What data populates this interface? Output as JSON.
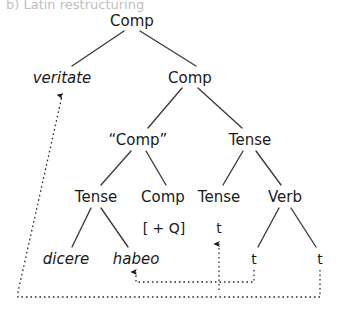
{
  "figure": {
    "caption": "b)  Latin restructuring",
    "background_color": "#ffffff",
    "line_color": "#3a3a3a",
    "text_color": "#1a1a1a",
    "width": 340,
    "height": 317
  },
  "tree": {
    "nodes": [
      {
        "id": "comp-root",
        "label": "Comp",
        "x": 132,
        "y": 21,
        "style": "plain"
      },
      {
        "id": "veritate",
        "label": "veritate",
        "x": 62,
        "y": 78,
        "style": "italic"
      },
      {
        "id": "comp-2",
        "label": "Comp",
        "x": 190,
        "y": 78,
        "style": "plain"
      },
      {
        "id": "comp-quoted",
        "label": "“Comp”",
        "x": 138,
        "y": 140,
        "style": "plain"
      },
      {
        "id": "tense-right",
        "label": "Tense",
        "x": 250,
        "y": 140,
        "style": "plain"
      },
      {
        "id": "tense-l1",
        "label": "Tense",
        "x": 96,
        "y": 197,
        "style": "plain"
      },
      {
        "id": "comp-l1",
        "label": "Comp",
        "x": 163,
        "y": 197,
        "style": "plain"
      },
      {
        "id": "tense-l2",
        "label": "Tense",
        "x": 219,
        "y": 197,
        "style": "plain"
      },
      {
        "id": "verb",
        "label": "Verb",
        "x": 285,
        "y": 197,
        "style": "plain"
      },
      {
        "id": "feature-q",
        "label": "[ + Q]",
        "x": 164,
        "y": 228,
        "style": "feature"
      },
      {
        "id": "trace-tense",
        "label": "t",
        "x": 219,
        "y": 228,
        "style": "trace"
      },
      {
        "id": "dicere",
        "label": "dicere",
        "x": 66,
        "y": 259,
        "style": "italic"
      },
      {
        "id": "habeo",
        "label": "habeo",
        "x": 136,
        "y": 259,
        "style": "italic"
      },
      {
        "id": "trace-verb-1",
        "label": "t",
        "x": 254,
        "y": 259,
        "style": "trace"
      },
      {
        "id": "trace-verb-2",
        "label": "t",
        "x": 320,
        "y": 259,
        "style": "trace"
      }
    ],
    "branches": [
      {
        "id": "root-to-veritate",
        "from": [
          124,
          31
        ],
        "to": [
          72,
          66
        ]
      },
      {
        "id": "root-to-comp2",
        "from": [
          140,
          31
        ],
        "to": [
          196,
          66
        ]
      },
      {
        "id": "comp2-to-quoted",
        "from": [
          182,
          88
        ],
        "to": [
          148,
          128
        ]
      },
      {
        "id": "comp2-to-tense",
        "from": [
          198,
          88
        ],
        "to": [
          242,
          128
        ]
      },
      {
        "id": "quoted-to-tense",
        "from": [
          131,
          151
        ],
        "to": [
          101,
          185
        ]
      },
      {
        "id": "quoted-to-comp",
        "from": [
          146,
          151
        ],
        "to": [
          166,
          185
        ]
      },
      {
        "id": "tenseR-to-tense",
        "from": [
          243,
          151
        ],
        "to": [
          223,
          185
        ]
      },
      {
        "id": "tenseR-to-verb",
        "from": [
          256,
          151
        ],
        "to": [
          281,
          185
        ]
      },
      {
        "id": "tense-to-dicere",
        "from": [
          91,
          208
        ],
        "to": [
          72,
          247
        ]
      },
      {
        "id": "tense-to-habeo",
        "from": [
          101,
          208
        ],
        "to": [
          128,
          247
        ]
      },
      {
        "id": "verb-to-trace1",
        "from": [
          279,
          208
        ],
        "to": [
          258,
          247
        ]
      },
      {
        "id": "verb-to-trace2",
        "from": [
          291,
          208
        ],
        "to": [
          316,
          247
        ]
      }
    ],
    "movement_arrows": [
      {
        "id": "move-verb-to-veritate",
        "points": [
          [
            320,
            270
          ],
          [
            320,
            297
          ],
          [
            18,
            297
          ],
          [
            18,
            292
          ],
          [
            62,
            96
          ]
        ],
        "arrow_at": [
          62,
          92
        ],
        "description": "rightmost trace raises to veritate"
      },
      {
        "id": "move-habeo-to-tense",
        "points": [
          [
            254,
            270
          ],
          [
            254,
            282
          ],
          [
            136,
            282
          ],
          [
            136,
            272
          ]
        ],
        "arrow_at": [
          136,
          268
        ],
        "description": "trace raises to habeo"
      },
      {
        "id": "move-trace-to-tense",
        "points": [
          [
            219,
            290
          ],
          [
            219,
            244
          ]
        ],
        "arrow_at": [
          219,
          240
        ],
        "description": "trace raises to Tense head"
      }
    ]
  }
}
